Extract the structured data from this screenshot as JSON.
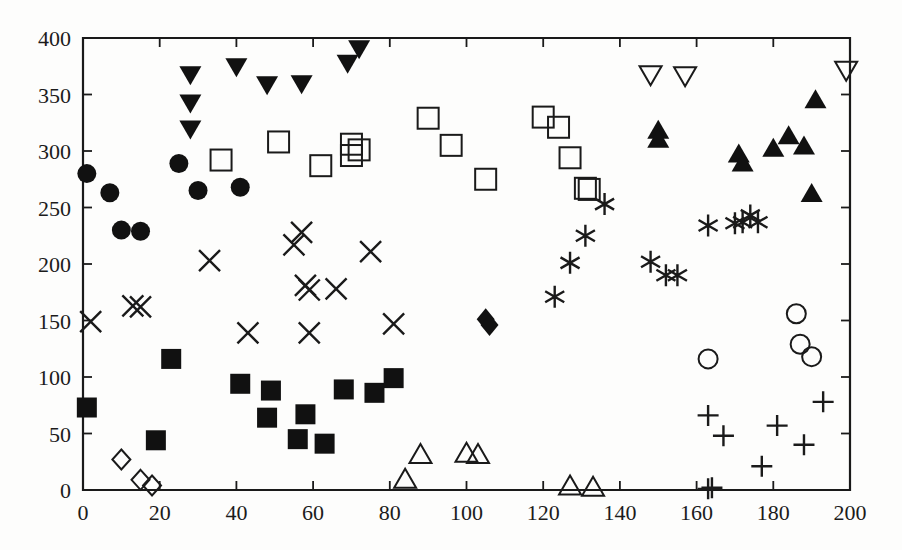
{
  "chart_data": {
    "type": "scatter",
    "title": "",
    "subtitle": "",
    "xlabel": "",
    "ylabel": "",
    "xlim": [
      0,
      200
    ],
    "ylim": [
      0,
      400
    ],
    "xticks": [
      0,
      20,
      40,
      60,
      80,
      100,
      120,
      140,
      160,
      180,
      200
    ],
    "yticks": [
      0,
      50,
      100,
      150,
      200,
      250,
      300,
      350,
      400
    ],
    "xtick_labels": [
      "0",
      "20",
      "40",
      "60",
      "80",
      "100",
      "120",
      "140",
      "160",
      "180",
      "200"
    ],
    "ytick_labels": [
      "0",
      "50",
      "100",
      "150",
      "200",
      "250",
      "300",
      "350",
      "400"
    ],
    "grid": false,
    "legend": "none",
    "series": [
      {
        "name": "filled-circle",
        "marker": "filled-circle",
        "points": [
          [
            1,
            280
          ],
          [
            7,
            263
          ],
          [
            10,
            230
          ],
          [
            15,
            229
          ],
          [
            25,
            289
          ],
          [
            30,
            265
          ],
          [
            41,
            268
          ]
        ]
      },
      {
        "name": "filled-down-triangle",
        "marker": "filled-down-triangle",
        "points": [
          [
            28,
            368
          ],
          [
            28,
            343
          ],
          [
            28,
            320
          ],
          [
            40,
            375
          ],
          [
            48,
            359
          ],
          [
            57,
            360
          ],
          [
            69,
            378
          ],
          [
            72,
            391
          ]
        ]
      },
      {
        "name": "open-square",
        "marker": "open-square",
        "points": [
          [
            36,
            292
          ],
          [
            51,
            308
          ],
          [
            62,
            287
          ],
          [
            70,
            306
          ],
          [
            70,
            296
          ],
          [
            72,
            301
          ],
          [
            90,
            329
          ],
          [
            96,
            305
          ],
          [
            105,
            275
          ],
          [
            120,
            330
          ],
          [
            124,
            321
          ],
          [
            127,
            294
          ],
          [
            131,
            267
          ],
          [
            132,
            266
          ]
        ]
      },
      {
        "name": "cross-x",
        "marker": "x",
        "points": [
          [
            2,
            149
          ],
          [
            13,
            163
          ],
          [
            15,
            162
          ],
          [
            33,
            203
          ],
          [
            43,
            139
          ],
          [
            55,
            217
          ],
          [
            57,
            228
          ],
          [
            58,
            181
          ],
          [
            59,
            177
          ],
          [
            59,
            139
          ],
          [
            66,
            178
          ],
          [
            75,
            211
          ],
          [
            81,
            147
          ]
        ]
      },
      {
        "name": "filled-square",
        "marker": "filled-square",
        "points": [
          [
            1,
            73
          ],
          [
            23,
            116
          ],
          [
            19,
            44
          ],
          [
            41,
            94
          ],
          [
            49,
            88
          ],
          [
            48,
            64
          ],
          [
            56,
            45
          ],
          [
            58,
            67
          ],
          [
            63,
            41
          ],
          [
            68,
            89
          ],
          [
            76,
            86
          ],
          [
            81,
            99
          ]
        ]
      },
      {
        "name": "open-diamond",
        "marker": "open-diamond",
        "points": [
          [
            10,
            27
          ],
          [
            15,
            9
          ],
          [
            18,
            4
          ]
        ]
      },
      {
        "name": "open-up-triangle",
        "marker": "open-up-triangle",
        "points": [
          [
            84,
            9
          ],
          [
            88,
            31
          ],
          [
            100,
            32
          ],
          [
            103,
            31
          ],
          [
            127,
            3
          ],
          [
            133,
            2
          ]
        ]
      },
      {
        "name": "filled-diamond",
        "marker": "filled-diamond",
        "points": [
          [
            105,
            151
          ],
          [
            106,
            146
          ]
        ]
      },
      {
        "name": "asterisk",
        "marker": "asterisk",
        "points": [
          [
            123,
            171
          ],
          [
            127,
            201
          ],
          [
            131,
            225
          ],
          [
            136,
            253
          ],
          [
            148,
            202
          ],
          [
            152,
            190
          ],
          [
            155,
            190
          ],
          [
            163,
            234
          ],
          [
            170,
            236
          ],
          [
            172,
            237
          ],
          [
            174,
            243
          ],
          [
            176,
            237
          ]
        ]
      },
      {
        "name": "open-down-triangle",
        "marker": "open-down-triangle",
        "points": [
          [
            148,
            368
          ],
          [
            157,
            367
          ],
          [
            199,
            372
          ]
        ]
      },
      {
        "name": "filled-up-triangle",
        "marker": "filled-up-triangle",
        "points": [
          [
            150,
            318
          ],
          [
            150,
            310
          ],
          [
            171,
            297
          ],
          [
            172,
            289
          ],
          [
            180,
            302
          ],
          [
            184,
            313
          ],
          [
            188,
            304
          ],
          [
            190,
            262
          ],
          [
            191,
            345
          ]
        ]
      },
      {
        "name": "open-circle",
        "marker": "open-circle",
        "points": [
          [
            163,
            116
          ],
          [
            186,
            156
          ],
          [
            187,
            129
          ],
          [
            190,
            118
          ]
        ]
      },
      {
        "name": "plus",
        "marker": "plus",
        "points": [
          [
            163,
            66
          ],
          [
            163,
            1
          ],
          [
            164,
            2
          ],
          [
            167,
            48
          ],
          [
            177,
            21
          ],
          [
            181,
            57
          ],
          [
            188,
            40
          ],
          [
            193,
            78
          ]
        ]
      }
    ]
  },
  "axes": {
    "left_label": "",
    "bottom_label": ""
  }
}
